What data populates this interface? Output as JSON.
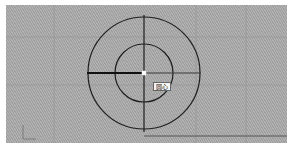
{
  "canvas": {
    "background_color": "#a9a9a9",
    "grid_color": "#9c9c9c",
    "line_color": "#1e1e1e"
  },
  "drawing": {
    "center": {
      "x": 138,
      "y": 68
    },
    "outer_circle_radius": 56,
    "inner_circle_radius": 29,
    "crosshair_vertical": {
      "y1": 10,
      "y2": 127
    },
    "crosshair_horizontal": {
      "x1": 81,
      "x2": 195
    },
    "bold_segment": {
      "x1": 81,
      "x2": 136
    },
    "baseline": {
      "x1": 138,
      "x2": 281,
      "y": 131
    }
  },
  "snap_tooltip": {
    "label": "圆心",
    "icon": "center-snap-marker"
  },
  "ucs_icon": {
    "name": "ucs-icon"
  }
}
